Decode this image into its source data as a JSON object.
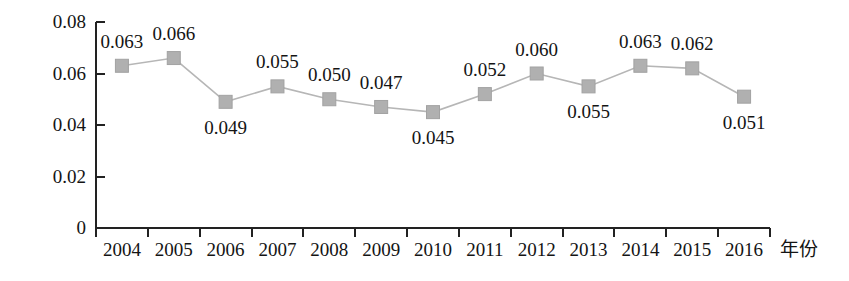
{
  "chart_data": {
    "type": "line",
    "title": "",
    "xlabel": "年份",
    "ylabel": "",
    "categories": [
      "2004",
      "2005",
      "2006",
      "2007",
      "2008",
      "2009",
      "2010",
      "2011",
      "2012",
      "2013",
      "2014",
      "2015",
      "2016"
    ],
    "values": [
      0.063,
      0.066,
      0.049,
      0.055,
      0.05,
      0.047,
      0.045,
      0.052,
      0.06,
      0.055,
      0.063,
      0.062,
      0.051
    ],
    "point_labels": [
      "0.063",
      "0.066",
      "0.049",
      "0.055",
      "0.050",
      "0.047",
      "0.045",
      "0.052",
      "0.060",
      "0.055",
      "0.063",
      "0.062",
      "0.051"
    ],
    "label_positions": [
      "above",
      "above",
      "below",
      "above",
      "above",
      "above",
      "below",
      "above",
      "above",
      "below",
      "above",
      "above",
      "below"
    ],
    "ylim": [
      0,
      0.08
    ],
    "yticks": [
      0,
      0.02,
      0.04,
      0.06,
      0.08
    ],
    "ytick_labels": [
      "0",
      "0.02",
      "0.04",
      "0.06",
      "0.08"
    ],
    "grid": false,
    "legend": false,
    "marker": "square",
    "series_color": "#b0b0b0",
    "axis_color": "#222222"
  }
}
